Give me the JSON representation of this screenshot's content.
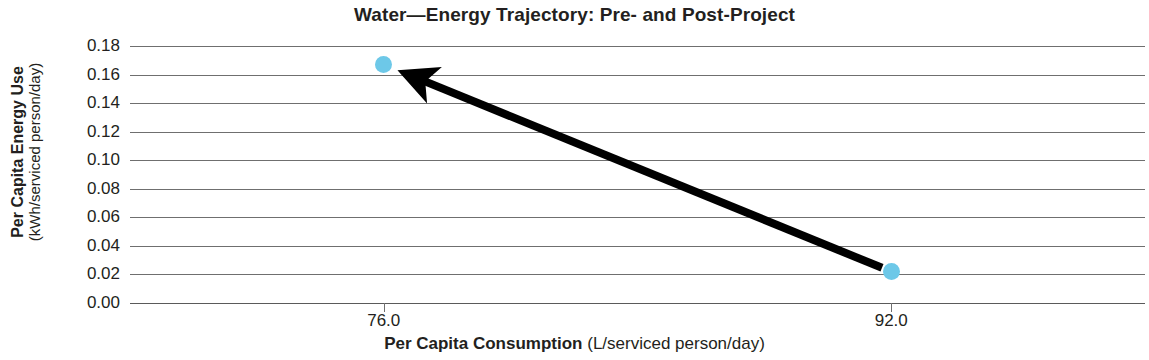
{
  "chart_data": {
    "type": "scatter",
    "title": "Water—Energy Trajectory: Pre- and Post-Project",
    "xlabel_main": "Per Capita Consumption",
    "xlabel_unit": "(L/serviced person/day)",
    "ylabel_main": "Per Capita Energy Use",
    "ylabel_unit": "(kWh/serviced person/day)",
    "x": [
      92.0,
      76.0
    ],
    "y": [
      0.022,
      0.167
    ],
    "point_labels": [
      "Pre-Project",
      "Post-Project"
    ],
    "xticks": [
      "76.0",
      "92.0"
    ],
    "xtick_values": [
      76.0,
      92.0
    ],
    "yticks": [
      "0.00",
      "0.02",
      "0.04",
      "0.06",
      "0.08",
      "0.10",
      "0.12",
      "0.14",
      "0.16",
      "0.18"
    ],
    "ytick_values": [
      0.0,
      0.02,
      0.04,
      0.06,
      0.08,
      0.1,
      0.12,
      0.14,
      0.16,
      0.18
    ],
    "ylim": [
      0.0,
      0.18
    ],
    "xlim": [
      68.0,
      100.0
    ],
    "grid": "horizontal",
    "legend": "none",
    "marker_color": "#6dc8e8",
    "arrow_color": "#000000",
    "gridline_color": "#6f6f6f",
    "annotations": [
      {
        "kind": "arrow",
        "from_x": 92.0,
        "from_y": 0.022,
        "to_x": 76.0,
        "to_y": 0.167
      }
    ]
  }
}
